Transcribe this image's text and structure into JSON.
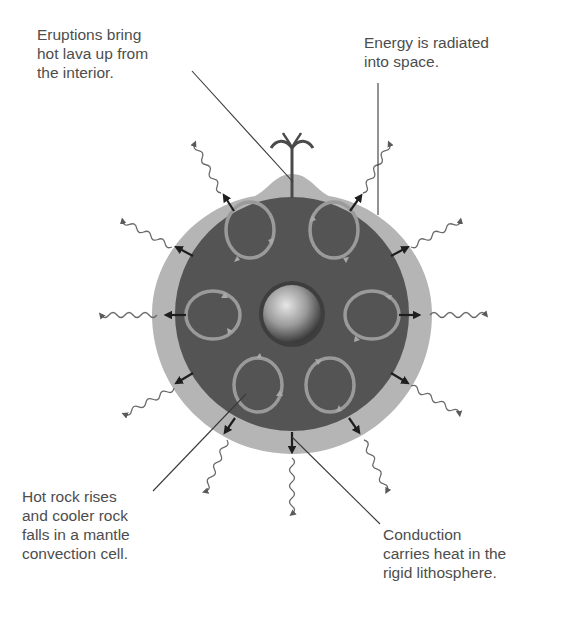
{
  "labels": {
    "eruptions": "Eruptions bring\nhot lava up from\nthe interior.",
    "radiation": "Energy is radiated\ninto space.",
    "convection": "Hot rock rises\nand cooler rock\nfalls in a mantle\nconvection cell.",
    "conduction": "Conduction\ncarries heat in the\nrigid lithosphere."
  },
  "colors": {
    "lithosphere": "#b5b5b5",
    "mantle": "#545454",
    "core_light": "#e0e0e0",
    "core_dark": "#3e3e3e",
    "convection_cell": "#9a9a9a",
    "arrow": "#1e1e1e",
    "wave": "#6a6a6a",
    "leader_line": "#3a3a3a"
  },
  "layers": [
    "lithosphere",
    "mantle",
    "core"
  ],
  "convection_cell_count": 8,
  "heat_arrow_count": 12
}
